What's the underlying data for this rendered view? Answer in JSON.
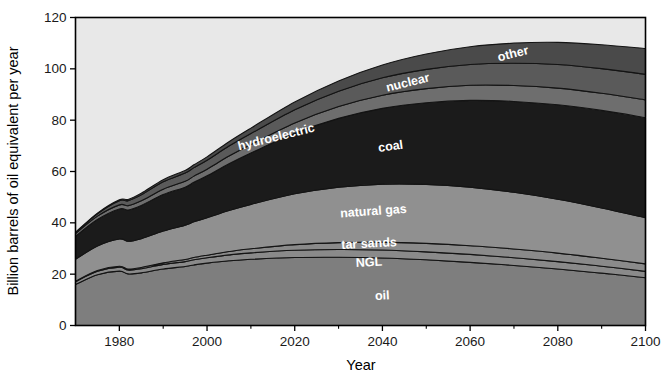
{
  "chart_data": {
    "type": "area",
    "stacked": true,
    "title": "",
    "xlabel": "Year",
    "ylabel": "Billion barrels of oil equivalent per year",
    "xlim": [
      1970,
      2100
    ],
    "ylim": [
      0,
      120
    ],
    "xticks": [
      1980,
      2000,
      2020,
      2040,
      2060,
      2080,
      2100
    ],
    "yticks": [
      0,
      20,
      40,
      60,
      80,
      100,
      120
    ],
    "grid": false,
    "legend": "inline-labels",
    "x": [
      1970,
      1975,
      1980,
      1982,
      1985,
      1990,
      1995,
      1997,
      2000,
      2005,
      2010,
      2020,
      2030,
      2040,
      2050,
      2060,
      2070,
      2080,
      2090,
      2100
    ],
    "series": [
      {
        "name": "oil",
        "label": "oil",
        "color": "#7e7e7e",
        "values": [
          16.0,
          19.8,
          21.2,
          20.1,
          20.5,
          22.0,
          23.0,
          23.6,
          24.3,
          25.2,
          25.8,
          26.5,
          26.6,
          26.3,
          25.6,
          24.6,
          23.4,
          22.0,
          20.4,
          18.6
        ]
      },
      {
        "name": "NGL",
        "label": "NGL",
        "color": "#8a8a8a",
        "values": [
          1.1,
          1.3,
          1.5,
          1.5,
          1.6,
          1.8,
          1.9,
          2.0,
          2.1,
          2.3,
          2.5,
          2.8,
          3.0,
          3.1,
          3.1,
          3.1,
          3.0,
          2.9,
          2.7,
          2.5
        ]
      },
      {
        "name": "tar sands",
        "label": "tar sands",
        "color": "#8a8a8a",
        "values": [
          0.2,
          0.3,
          0.4,
          0.4,
          0.5,
          0.6,
          0.8,
          0.9,
          1.0,
          1.3,
          1.6,
          2.2,
          2.7,
          3.1,
          3.3,
          3.4,
          3.4,
          3.3,
          3.1,
          2.9
        ]
      },
      {
        "name": "natural gas",
        "label": "natural gas",
        "color": "#909090",
        "values": [
          8.5,
          9.6,
          10.6,
          10.8,
          11.2,
          12.4,
          13.4,
          13.9,
          14.6,
          16.0,
          17.3,
          19.8,
          21.6,
          22.6,
          23.0,
          22.8,
          22.1,
          21.0,
          19.6,
          18.0
        ]
      },
      {
        "name": "coal",
        "label": "coal",
        "color": "#1b1b1b",
        "values": [
          9.0,
          10.3,
          11.7,
          12.2,
          13.0,
          14.2,
          14.8,
          15.4,
          16.3,
          18.2,
          20.0,
          23.6,
          26.8,
          29.5,
          31.8,
          33.8,
          35.4,
          36.8,
          38.0,
          39.0
        ]
      },
      {
        "name": "hydroelectric",
        "label": "hydroelectric",
        "color": "#6e6e6e",
        "values": [
          1.0,
          1.3,
          1.6,
          1.7,
          1.8,
          2.1,
          2.3,
          2.4,
          2.6,
          3.0,
          3.3,
          4.0,
          4.6,
          5.1,
          5.5,
          5.9,
          6.2,
          6.5,
          6.7,
          6.9
        ]
      },
      {
        "name": "nuclear",
        "label": "nuclear",
        "color": "#5a5a5a",
        "values": [
          0.3,
          0.9,
          1.6,
          1.9,
          2.3,
          2.9,
          3.2,
          3.3,
          3.5,
          3.9,
          4.3,
          5.2,
          6.0,
          6.8,
          7.5,
          8.1,
          8.7,
          9.2,
          9.6,
          10.0
        ]
      },
      {
        "name": "other",
        "label": "other",
        "color": "#4a4a4a",
        "values": [
          0.2,
          0.3,
          0.4,
          0.5,
          0.6,
          0.8,
          1.0,
          1.1,
          1.3,
          1.7,
          2.1,
          3.0,
          4.0,
          5.0,
          6.0,
          6.9,
          7.8,
          8.6,
          9.3,
          10.0
        ]
      }
    ],
    "band_labels": [
      {
        "name": "oil",
        "text": "oil",
        "x": 2040,
        "frac": 0.45,
        "rotate": -3
      },
      {
        "name": "NGL",
        "text": "NGL",
        "x": 2037,
        "frac": 0.5,
        "rotate": -3,
        "offset_y": 8
      },
      {
        "name": "tar sands",
        "text": "tar sands",
        "x": 2037,
        "frac": 0.5,
        "rotate": -3,
        "offset_y": -3
      },
      {
        "name": "natural gas",
        "text": "natural gas",
        "x": 2038,
        "frac": 0.55,
        "rotate": -4
      },
      {
        "name": "coal",
        "text": "coal",
        "x": 2042,
        "frac": 0.5,
        "rotate": -8
      },
      {
        "name": "hydroelectric",
        "text": "hydroelectric",
        "x": 2016,
        "frac": 0.5,
        "rotate": -14
      },
      {
        "name": "nuclear",
        "text": "nuclear",
        "x": 2046,
        "frac": 0.5,
        "rotate": -14
      },
      {
        "name": "other",
        "text": "other",
        "x": 2070,
        "frac": 0.5,
        "rotate": -14
      }
    ],
    "plot_background": "#e8e8e8",
    "frame_color": "#000000"
  }
}
